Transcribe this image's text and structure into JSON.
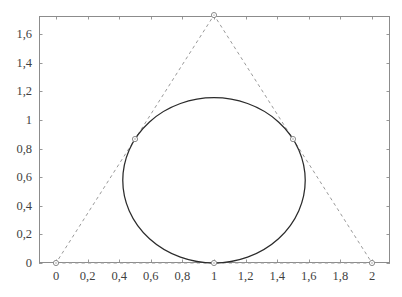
{
  "chart_data": {
    "type": "line",
    "title": "",
    "subtitle": "",
    "xlabel": "",
    "ylabel": "",
    "xlim": [
      -0.11,
      2.12
    ],
    "ylim": [
      -0.035,
      1.78
    ],
    "grid": false,
    "legend": null,
    "x_ticks": [
      0,
      0.2,
      0.4,
      0.6,
      0.8,
      1,
      1.2,
      1.4,
      1.6,
      1.8,
      2
    ],
    "x_tick_labels": [
      "0",
      "0,2",
      "0,4",
      "0,6",
      "0,8",
      "1",
      "1,2",
      "1,4",
      "1,6",
      "1,8",
      "2"
    ],
    "y_ticks": [
      0,
      0.2,
      0.4,
      0.6,
      0.8,
      1,
      1.2,
      1.4,
      1.6
    ],
    "y_tick_labels": [
      "0",
      "0,2",
      "0,4",
      "0,6",
      "0,8",
      "1",
      "1,2",
      "1,4",
      "1,6"
    ],
    "series": [
      {
        "name": "triangle",
        "type": "line",
        "style": "dashed",
        "color": "#9a9a9a",
        "closed": true,
        "points": [
          [
            0,
            0
          ],
          [
            2,
            0
          ],
          [
            1,
            1.7321
          ],
          [
            0,
            0
          ]
        ]
      },
      {
        "name": "incircle",
        "type": "circle",
        "style": "solid",
        "color": "#2b2b2b",
        "center": [
          1,
          0.5774
        ],
        "radius": 0.5774,
        "top": 1.1547,
        "left": 0.4226,
        "right": 1.5774,
        "bottom": 0
      }
    ],
    "markers": [
      {
        "name": "vertex-origin",
        "x": 0,
        "y": 0,
        "label": ""
      },
      {
        "name": "vertex-right",
        "x": 2,
        "y": 0,
        "label": ""
      },
      {
        "name": "vertex-apex",
        "x": 1,
        "y": 1.7321,
        "label": ""
      },
      {
        "name": "tangent-left",
        "x": 0.5,
        "y": 0.866,
        "label": ""
      },
      {
        "name": "tangent-right",
        "x": 1.5,
        "y": 0.866,
        "label": ""
      },
      {
        "name": "tangent-bottom",
        "x": 1,
        "y": 0,
        "label": ""
      }
    ],
    "colors": {
      "frame": "#8c8c8c",
      "dashed_line": "#9a9a9a",
      "circle": "#2b2b2b",
      "marker_stroke": "#8c8c8c",
      "marker_fill": "#ffffff",
      "tick_label": "#3f3f3f",
      "background": "#ffffff"
    }
  }
}
